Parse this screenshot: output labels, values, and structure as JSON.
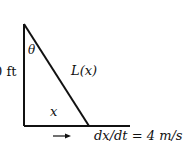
{
  "diagram": {
    "height_label": "0 ft",
    "angle_label": "θ",
    "hypotenuse_label": "L(x)",
    "base_label": "x",
    "rate_label": "dx/dt = 4 m/s",
    "arrow": "→"
  }
}
